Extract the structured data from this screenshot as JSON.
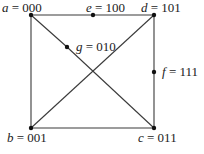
{
  "diagram": {
    "type": "graph",
    "nodes": [
      {
        "id": "a",
        "var": "a",
        "code": "000",
        "x": 31,
        "y": 15,
        "label_x": 2,
        "label_y": 12
      },
      {
        "id": "e",
        "var": "e",
        "code": "100",
        "x": 93,
        "y": 15,
        "label_x": 86,
        "label_y": 12
      },
      {
        "id": "d",
        "var": "d",
        "code": "101",
        "x": 154,
        "y": 15,
        "label_x": 141,
        "label_y": 12
      },
      {
        "id": "g",
        "var": "g",
        "code": "010",
        "x": 67,
        "y": 47,
        "label_x": 76,
        "label_y": 51
      },
      {
        "id": "f",
        "var": "f",
        "code": "111",
        "x": 154,
        "y": 72,
        "label_x": 162,
        "label_y": 76
      },
      {
        "id": "b",
        "var": "b",
        "code": "001",
        "x": 31,
        "y": 128,
        "label_x": 7,
        "label_y": 142
      },
      {
        "id": "c",
        "var": "c",
        "code": "011",
        "x": 154,
        "y": 128,
        "label_x": 138,
        "label_y": 142
      }
    ],
    "edges": [
      [
        "a",
        "e"
      ],
      [
        "e",
        "d"
      ],
      [
        "a",
        "b"
      ],
      [
        "a",
        "g"
      ],
      [
        "g",
        "c"
      ],
      [
        "d",
        "f"
      ],
      [
        "f",
        "c"
      ],
      [
        "d",
        "b"
      ],
      [
        "b",
        "c"
      ]
    ],
    "equals_sign": "=",
    "caption": ""
  }
}
